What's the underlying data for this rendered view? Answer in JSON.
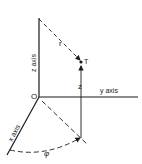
{
  "diagram": {
    "type": "cylindrical-coordinates",
    "labels": {
      "z_axis": "z axis",
      "y_axis": "y axis",
      "x_axis": "x axis",
      "origin": "O",
      "radius": "r",
      "point": "T",
      "height": "z",
      "angle": "φ"
    },
    "colors": {
      "ink": "#1a1a1a",
      "background": "#ffffff"
    }
  }
}
